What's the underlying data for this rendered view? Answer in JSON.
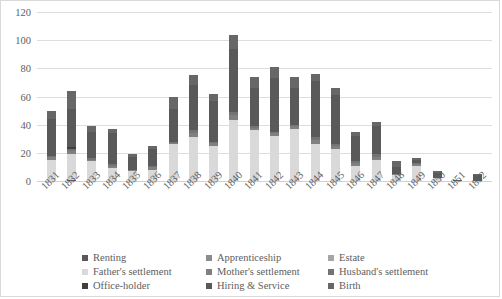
{
  "chart_data": {
    "type": "bar",
    "stacked": true,
    "title": "",
    "xlabel": "",
    "ylabel": "",
    "ylim": [
      0,
      120
    ],
    "ytick_step": 20,
    "yticks": [
      0,
      20,
      40,
      60,
      80,
      100,
      120
    ],
    "grid": true,
    "legend_position": "bottom",
    "categories": [
      "1831",
      "1832",
      "1833",
      "1834",
      "1835",
      "1836",
      "1837",
      "1838",
      "1839",
      "1840",
      "1841",
      "1842",
      "1843",
      "1844",
      "1845",
      "1846",
      "1847",
      "1848",
      "1849",
      "1850",
      "1851",
      "1852"
    ],
    "series": [
      {
        "name": "Renting",
        "color": "#595959",
        "values": [
          0,
          1,
          0,
          0,
          0,
          0,
          0,
          0,
          0,
          0,
          0,
          0,
          0,
          0,
          0,
          0,
          0,
          0,
          0,
          0,
          0,
          0
        ]
      },
      {
        "name": "Apprenticeship",
        "color": "#8c8c8c",
        "values": [
          0,
          0,
          0,
          0,
          0,
          0,
          0,
          0,
          0,
          0,
          0,
          0,
          0,
          0,
          0,
          0,
          0,
          0,
          0,
          0,
          0,
          0
        ]
      },
      {
        "name": "Estate",
        "color": "#a6a6a6",
        "values": [
          0,
          0,
          0,
          0,
          0,
          0,
          0,
          0,
          0,
          0,
          0,
          0,
          0,
          0,
          0,
          0,
          0,
          0,
          0,
          0,
          0,
          0
        ]
      },
      {
        "name": "Father's settlement",
        "color": "#d9d9d9",
        "values": [
          15,
          18,
          14,
          9,
          7,
          8,
          26,
          31,
          25,
          43,
          36,
          32,
          37,
          26,
          23,
          11,
          15,
          4,
          11,
          2,
          0,
          0
        ]
      },
      {
        "name": "Mother's settlement",
        "color": "#808080",
        "values": [
          2,
          2,
          1,
          2,
          1,
          2,
          1,
          3,
          2,
          4,
          2,
          2,
          2,
          3,
          2,
          2,
          2,
          1,
          1,
          0,
          0,
          0
        ]
      },
      {
        "name": "Husband's settlement",
        "color": "#737373",
        "values": [
          1,
          2,
          1,
          1,
          0,
          1,
          1,
          2,
          1,
          2,
          1,
          1,
          1,
          2,
          1,
          1,
          2,
          0,
          1,
          0,
          0,
          0
        ]
      },
      {
        "name": "Office-holder",
        "color": "#3f3f3f",
        "values": [
          0,
          1,
          0,
          0,
          0,
          0,
          0,
          0,
          0,
          0,
          0,
          0,
          0,
          0,
          0,
          0,
          0,
          0,
          0,
          0,
          0,
          0
        ]
      },
      {
        "name": "Hiring & Service",
        "color": "#595959",
        "values": [
          26,
          27,
          19,
          22,
          9,
          12,
          23,
          32,
          29,
          45,
          27,
          38,
          26,
          40,
          35,
          18,
          20,
          5,
          2,
          4,
          1,
          4
        ]
      },
      {
        "name": "Birth",
        "color": "#676767",
        "values": [
          6,
          13,
          4,
          3,
          2,
          2,
          9,
          7,
          5,
          10,
          8,
          8,
          8,
          5,
          5,
          3,
          3,
          4,
          1,
          1,
          0,
          1
        ]
      }
    ],
    "totals": [
      50,
      64,
      39,
      37,
      19,
      25,
      60,
      75,
      62,
      104,
      74,
      81,
      74,
      76,
      66,
      35,
      42,
      14,
      16,
      7,
      1,
      5
    ]
  },
  "legend": {
    "rows": [
      [
        {
          "label": "Renting",
          "swatch": "legend-swatch-renting"
        },
        {
          "label": "Apprenticeship",
          "swatch": "legend-swatch-apprenticeship"
        },
        {
          "label": "Estate",
          "swatch": "legend-swatch-estate"
        }
      ],
      [
        {
          "label": "Father's settlement",
          "swatch": "legend-swatch-fathers-settlement"
        },
        {
          "label": "Mother's settlement",
          "swatch": "legend-swatch-mothers-settlement"
        },
        {
          "label": "Husband's settlement",
          "swatch": "legend-swatch-husbands-settlement"
        }
      ],
      [
        {
          "label": "Office-holder",
          "swatch": "legend-swatch-office-holder"
        },
        {
          "label": "Hiring & Service",
          "swatch": "legend-swatch-hiring-and-service"
        },
        {
          "label": "Birth",
          "swatch": "legend-swatch-birth"
        }
      ]
    ]
  }
}
